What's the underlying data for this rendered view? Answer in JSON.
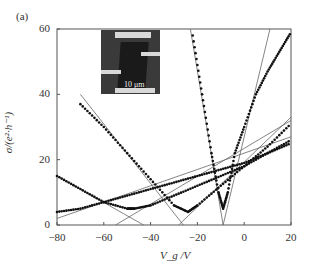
{
  "panel_label": "(a)",
  "inset_scale_label": "10 μm",
  "chart_data": {
    "type": "scatter",
    "title": "",
    "xlabel": "V_g /V",
    "ylabel": "σ/(e²·h⁻¹)",
    "xlim": [
      -80,
      20
    ],
    "ylim": [
      0,
      60
    ],
    "xticks": [
      -80,
      -60,
      -40,
      -20,
      0,
      20
    ],
    "yticks": [
      0,
      20,
      40,
      60
    ],
    "grid": false,
    "legend": null,
    "annotations": [
      "inset micrograph with 10 μm scale bar"
    ],
    "series": [
      {
        "name": "curve-1 (sharp min near Vg≈-9)",
        "x": [
          -22,
          -18,
          -14,
          -11,
          -9,
          -7,
          -4,
          0,
          5,
          10,
          15,
          20
        ],
        "y": [
          58,
          40,
          22,
          10,
          5,
          10,
          22,
          30,
          40,
          47,
          53,
          59
        ]
      },
      {
        "name": "curve-2 (min near Vg≈-24)",
        "x": [
          -70,
          -60,
          -50,
          -40,
          -30,
          -24,
          -20,
          -10,
          0,
          10,
          20
        ],
        "y": [
          37,
          30,
          22,
          14,
          6,
          4,
          6,
          12,
          18,
          24,
          31
        ]
      },
      {
        "name": "curve-3 (min near Vg≈-47)",
        "x": [
          -80,
          -70,
          -60,
          -50,
          -47,
          -40,
          -30,
          -20,
          -10,
          0,
          10,
          20
        ],
        "y": [
          15,
          11,
          7,
          5,
          5,
          6,
          9,
          12,
          15,
          18,
          22,
          26
        ]
      },
      {
        "name": "curve-4 (nearly linear)",
        "x": [
          -80,
          -70,
          -60,
          -50,
          -40,
          -30,
          -20,
          -10,
          0,
          10,
          20
        ],
        "y": [
          4,
          5,
          7,
          9,
          11,
          13,
          15,
          17,
          19,
          22,
          25
        ]
      }
    ],
    "fit_lines": [
      {
        "x": [
          -23,
          -9
        ],
        "y": [
          60,
          0
        ]
      },
      {
        "x": [
          -9,
          11
        ],
        "y": [
          0,
          60
        ]
      },
      {
        "x": [
          -70,
          -26
        ],
        "y": [
          40,
          0
        ]
      },
      {
        "x": [
          -28,
          20
        ],
        "y": [
          0,
          33
        ]
      },
      {
        "x": [
          -80,
          -43
        ],
        "y": [
          15,
          0
        ]
      },
      {
        "x": [
          -55,
          20
        ],
        "y": [
          0,
          32
        ]
      },
      {
        "x": [
          -80,
          20
        ],
        "y": [
          2,
          27
        ]
      }
    ]
  }
}
